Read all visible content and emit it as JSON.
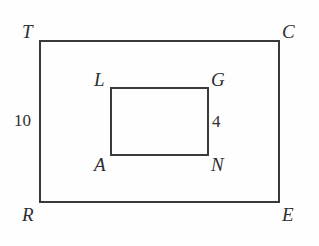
{
  "diagram": {
    "background_color": "#fefefe",
    "stroke_color": "#3a3a3c",
    "label_color": "#2e2e30",
    "stroke_width": 2,
    "outer_rectangle": {
      "name": "TCER",
      "vertices": [
        {
          "label": "T",
          "role": "top-left",
          "x": 40,
          "y": 41
        },
        {
          "label": "C",
          "role": "top-right",
          "x": 279,
          "y": 41
        },
        {
          "label": "E",
          "role": "bottom-right",
          "x": 279,
          "y": 202
        },
        {
          "label": "R",
          "role": "bottom-left",
          "x": 40,
          "y": 202
        }
      ],
      "labels": {
        "top_left": "T",
        "top_right": "C",
        "bottom_left": "R",
        "bottom_right": "E"
      },
      "side_measure": {
        "value": "10",
        "side": "TR",
        "position": "left"
      }
    },
    "inner_rectangle": {
      "name": "LGNA",
      "vertices": [
        {
          "label": "L",
          "role": "top-left",
          "x": 111,
          "y": 88
        },
        {
          "label": "G",
          "role": "top-right",
          "x": 208,
          "y": 88
        },
        {
          "label": "N",
          "role": "bottom-right",
          "x": 208,
          "y": 155
        },
        {
          "label": "A",
          "role": "bottom-left",
          "x": 111,
          "y": 155
        }
      ],
      "labels": {
        "top_left": "L",
        "top_right": "G",
        "bottom_left": "A",
        "bottom_right": "N"
      },
      "side_measure": {
        "value": "4",
        "side": "GN",
        "position": "right"
      }
    },
    "measures": [
      {
        "value": "10",
        "applies_to": "TR",
        "units": ""
      },
      {
        "value": "4",
        "applies_to": "GN",
        "units": ""
      }
    ]
  }
}
